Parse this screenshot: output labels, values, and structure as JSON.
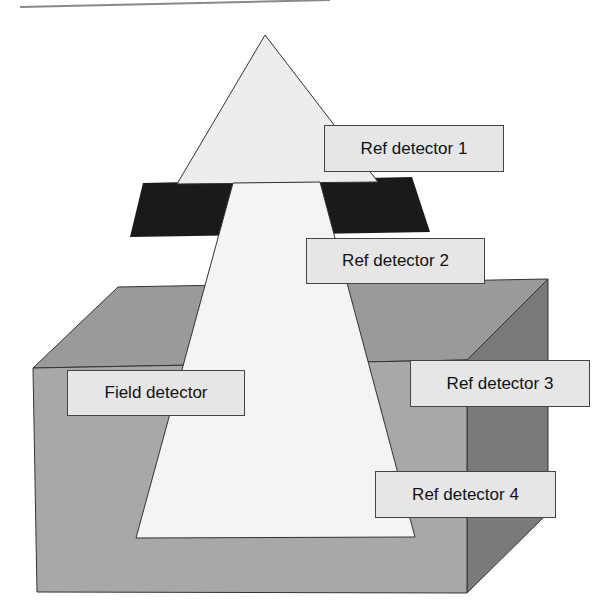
{
  "diagram": {
    "colors": {
      "box_front": "#a8a8a8",
      "box_top": "#9a9a9a",
      "box_side": "#7a7a7a",
      "collimator": "#1a1a1a",
      "beam_upper": "#ededed",
      "beam_lower": "#f4f4f4",
      "label_bg": "#e6e6e6"
    },
    "labels": {
      "ref1": "Ref detector 1",
      "ref2": "Ref detector 2",
      "ref3": "Ref detector 3",
      "ref4": "Ref detector 4",
      "field": "Field detector"
    }
  }
}
